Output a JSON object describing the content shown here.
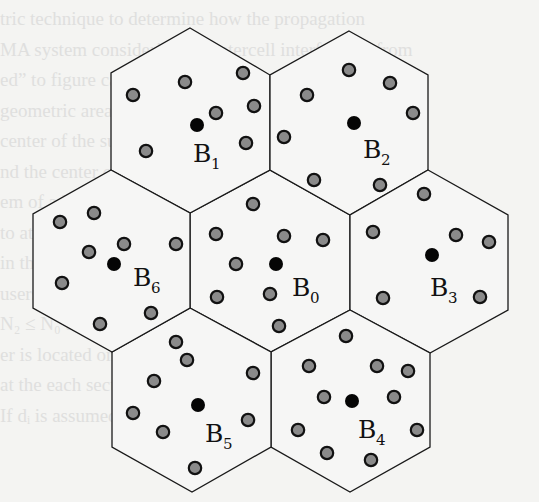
{
  "figure": {
    "colors": {
      "cell_fill": "#f6f6f5",
      "cell_stroke": "#1a1a1a",
      "base_station": "#050505",
      "mobile_fill": "#8a8a8a",
      "mobile_stroke": "#111111",
      "background": "#f4f4f2"
    },
    "cells": [
      {
        "id": "B0",
        "label": "B",
        "sub": "0",
        "hex": [
          [
            270,
            170
          ],
          [
            350,
            215
          ],
          [
            350,
            310
          ],
          [
            271,
            352
          ],
          [
            190,
            308
          ],
          [
            190,
            213
          ]
        ],
        "base_station": [
          276,
          264
        ],
        "label_pos": [
          292,
          296
        ],
        "mobiles": [
          [
            253,
            204
          ],
          [
            216,
            234
          ],
          [
            284,
            236
          ],
          [
            323,
            240
          ],
          [
            236,
            264
          ],
          [
            217,
            297
          ],
          [
            270,
            294
          ],
          [
            279,
            326
          ]
        ]
      },
      {
        "id": "B1",
        "label": "B",
        "sub": "1",
        "hex": [
          [
            190,
            28
          ],
          [
            270,
            75
          ],
          [
            270,
            170
          ],
          [
            190,
            213
          ],
          [
            111,
            170
          ],
          [
            111,
            73
          ]
        ],
        "base_station": [
          197,
          125
        ],
        "label_pos": [
          193,
          162
        ],
        "mobiles": [
          [
            133,
            95
          ],
          [
            185,
            82
          ],
          [
            243,
            73
          ],
          [
            254,
            106
          ],
          [
            216,
            113
          ],
          [
            246,
            143
          ],
          [
            146,
            151
          ]
        ]
      },
      {
        "id": "B2",
        "label": "B",
        "sub": "2",
        "hex": [
          [
            349,
            31
          ],
          [
            428,
            75
          ],
          [
            428,
            170
          ],
          [
            350,
            215
          ],
          [
            270,
            170
          ],
          [
            270,
            75
          ]
        ],
        "base_station": [
          354,
          123
        ],
        "label_pos": [
          363,
          158
        ],
        "mobiles": [
          [
            307,
            95
          ],
          [
            349,
            70
          ],
          [
            390,
            83
          ],
          [
            413,
            113
          ],
          [
            284,
            137
          ],
          [
            314,
            180
          ],
          [
            380,
            185
          ]
        ]
      },
      {
        "id": "B3",
        "label": "B",
        "sub": "3",
        "hex": [
          [
            428,
            170
          ],
          [
            508,
            215
          ],
          [
            508,
            310
          ],
          [
            430,
            353
          ],
          [
            350,
            310
          ],
          [
            350,
            215
          ]
        ],
        "base_station": [
          432,
          255
        ],
        "label_pos": [
          430,
          296
        ],
        "mobiles": [
          [
            424,
            194
          ],
          [
            373,
            232
          ],
          [
            456,
            235
          ],
          [
            489,
            242
          ],
          [
            383,
            298
          ],
          [
            480,
            297
          ]
        ]
      },
      {
        "id": "B4",
        "label": "B",
        "sub": "4",
        "hex": [
          [
            350,
            310
          ],
          [
            430,
            353
          ],
          [
            430,
            447
          ],
          [
            350,
            492
          ],
          [
            271,
            447
          ],
          [
            271,
            352
          ]
        ],
        "base_station": [
          352,
          401
        ],
        "label_pos": [
          358,
          438
        ],
        "mobiles": [
          [
            346,
            336
          ],
          [
            309,
            366
          ],
          [
            377,
            366
          ],
          [
            408,
            371
          ],
          [
            324,
            397
          ],
          [
            394,
            397
          ],
          [
            298,
            430
          ],
          [
            417,
            430
          ],
          [
            327,
            453
          ],
          [
            371,
            460
          ]
        ]
      },
      {
        "id": "B5",
        "label": "B",
        "sub": "5",
        "hex": [
          [
            190,
            308
          ],
          [
            271,
            352
          ],
          [
            271,
            447
          ],
          [
            192,
            492
          ],
          [
            112,
            447
          ],
          [
            112,
            352
          ]
        ],
        "base_station": [
          198,
          405
        ],
        "label_pos": [
          205,
          442
        ],
        "mobiles": [
          [
            176,
            342
          ],
          [
            187,
            360
          ],
          [
            253,
            373
          ],
          [
            154,
            381
          ],
          [
            133,
            413
          ],
          [
            248,
            420
          ],
          [
            163,
            432
          ],
          [
            195,
            468
          ]
        ]
      },
      {
        "id": "B6",
        "label": "B",
        "sub": "6",
        "hex": [
          [
            111,
            170
          ],
          [
            190,
            213
          ],
          [
            190,
            308
          ],
          [
            112,
            352
          ],
          [
            33,
            308
          ],
          [
            33,
            214
          ]
        ],
        "base_station": [
          114,
          264
        ],
        "label_pos": [
          133,
          286
        ],
        "mobiles": [
          [
            60,
            222
          ],
          [
            94,
            213
          ],
          [
            124,
            244
          ],
          [
            89,
            252
          ],
          [
            176,
            244
          ],
          [
            62,
            283
          ],
          [
            151,
            313
          ],
          [
            100,
            324
          ]
        ]
      }
    ]
  },
  "background_text": [
    "                           tric technique to determine how the propagation",
    "                          MA system considering the intercell interference from",
    "                          ed” to figure called other interferer cells are",
    "                          geometric area and so the effect of more th",
    "                          center of the surrounding interfering cells are",
    "                          nd the center cell of interest.",
    "                          em of adjacent cells.",
    "                          to at least have one cell, and assume that there",
    "                          in the center cell, which is located at the",
    "                          users in the cell of interest are located at distance",
    "                          N₂ ≤ N₀ then a total of N₀ mobile interfer",
    "                          er is located on both sides and with interfer",
    "                          at the each sector of the cell, there are N₀ total",
    "                          If dᵢ is assumed to be much less than R, then the"
  ]
}
